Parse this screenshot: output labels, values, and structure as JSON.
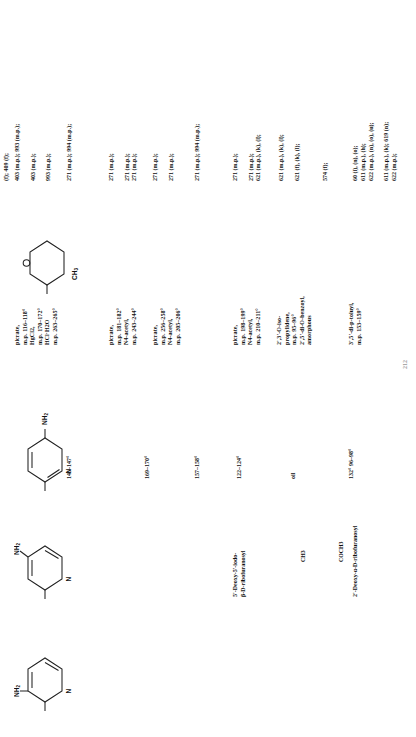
{
  "document": {
    "type": "scanned-reference-table",
    "orientation": "rotated-90-ccw",
    "page_number": "212"
  },
  "table": {
    "header": {
      "ref_col": "(f); 409 (f);"
    },
    "rows": [
      {
        "id": "row-1",
        "structure": "pyridine-3-amine",
        "name": "",
        "mp": "",
        "derivatives": "picrate,\nm.p. 116–118°\nHgCl2,\nm.p. 170–172°\nHCl·H2O\nm.p. 263–265°",
        "refs": "403 (m.p.); 993 (m.p.);\n\n403 (m.p.);\n\n993 (m.p.);"
      },
      {
        "id": "row-2",
        "structure": "",
        "name": "",
        "mp": "146–147°",
        "derivatives": "",
        "refs": "271 (m.p.); 994 (m.p.);"
      },
      {
        "id": "row-3",
        "structure": "pyridine-4-amine",
        "name": "",
        "mp": "",
        "derivatives": "picrate,\nm.p. 181–182°\nN4-acetyl,\nm.p. 243–244°",
        "refs": "271 (m.p.);\n\n271 (m.p.);\n271 (m.p.);"
      },
      {
        "id": "row-4",
        "structure": "",
        "name": "",
        "mp": "169–170°",
        "derivatives": "picrate,\nm.p. 256–258°\nN4-acetyl,\nm.p. 205–206°",
        "refs": "271 (m.p.);\n\n271 (m.p.);"
      },
      {
        "id": "row-5",
        "structure": "pyridine-2-amine",
        "name": "",
        "mp": "157–158°",
        "derivatives": "",
        "refs": "271 (m.p.); 994 (m.p.);"
      },
      {
        "id": "row-6",
        "structure": "",
        "name": "5'-Deoxy-5'-iodo-\nβ-D-ribofuranosyl",
        "mp": "122–124°",
        "derivatives": "picrate,\nm.p. 198–199°\nN4-acetyl,\nm.p. 210–211°",
        "refs": "271 (m.p.);\n\n271 (m.p.);\n621 (m.p.), (k), (l);"
      },
      {
        "id": "row-7",
        "structure": "",
        "name": "",
        "mp": "oil",
        "derivatives": "2',3'-O-iso-\npropylidene,\nm.p. 95–96°\n2',5'-di-O-benzoyl,\namorphous",
        "refs": "621 (m.p.), (k), (l);\n\n621 (f), (k), (l);"
      },
      {
        "id": "row-8",
        "structure": "",
        "name": "",
        "mp": "",
        "derivatives": "",
        "refs": "574 (f);"
      },
      {
        "id": "row-9",
        "structure": "tetrahydropyran-ribofuranosyl",
        "name": "2'-Deoxy-α-D-ribofuranosyl",
        "mp": "132°\n96–98°",
        "derivatives": "3',5'-di-p-toluyl,\nm.p. 153–159°",
        "refs": "60 (i), (n), (o);\n611 (m.p.), (h);\n622 (m.p.), (n), (o), (u);\n\n611 (m.p.), (k); 619 (n);\n622 (m.p.);"
      }
    ]
  },
  "structures": [
    {
      "id": "struct-1",
      "name": "3-aminopyridine-ring",
      "atom_labels": [
        "NH2",
        "N"
      ]
    },
    {
      "id": "struct-2",
      "name": "4-aminopyridine-ring",
      "atom_labels": [
        "NH2",
        "N"
      ]
    },
    {
      "id": "struct-3",
      "name": "2-aminopyridine-ring",
      "atom_labels": [
        "NH2",
        "N"
      ]
    },
    {
      "id": "struct-4",
      "name": "pyranose-ring",
      "atom_labels": [
        "O",
        "CH3"
      ]
    }
  ],
  "substituent_labels": {
    "acetyl": "COCH3",
    "methyl": "CH3"
  },
  "name_labels": {
    "iodo_ribofuranosyl": "5'-Deoxy-5'-iodo-\nβ-D-ribofuranosyl",
    "deoxy_ribofuranosyl": "2'-Deoxy-α-D-ribofuranosyl"
  },
  "colors": {
    "ink": "#111111",
    "paper": "#ffffff",
    "faded": "#9a9a9a"
  }
}
